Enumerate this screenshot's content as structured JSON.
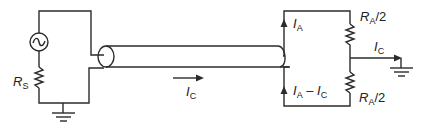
{
  "diagram": {
    "type": "circuit-schematic",
    "colors": {
      "wire": "#2b2b2b",
      "text": "#222222",
      "background": "#ffffff"
    },
    "labels": {
      "source_resistor": {
        "main": "R",
        "sub": "S"
      },
      "cable_current": {
        "main": "I",
        "sub": "C"
      },
      "upper_branch_current": {
        "main": "I",
        "sub": "A"
      },
      "lower_branch_current": {
        "main": "I",
        "sub": "A",
        "minus": " – ",
        "main2": "I",
        "sub2": "C"
      },
      "upper_resistor": {
        "main": "R",
        "sub": "A",
        "suffix": "/2"
      },
      "lower_resistor": {
        "main": "R",
        "sub": "A",
        "suffix": "/2"
      },
      "ground_current": {
        "main": "I",
        "sub": "C"
      }
    },
    "components": [
      {
        "id": "ac-source",
        "kind": "ac-voltage-source"
      },
      {
        "id": "source-resistor",
        "kind": "resistor",
        "label": "RS"
      },
      {
        "id": "coax-cable",
        "kind": "coaxial-cable"
      },
      {
        "id": "upper-resistor",
        "kind": "resistor",
        "label": "RA/2"
      },
      {
        "id": "lower-resistor",
        "kind": "resistor",
        "label": "RA/2"
      },
      {
        "id": "left-ground",
        "kind": "ground"
      },
      {
        "id": "right-ground",
        "kind": "ground"
      }
    ]
  }
}
